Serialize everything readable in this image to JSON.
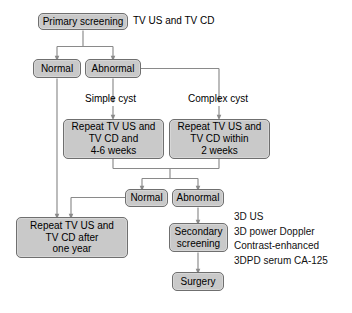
{
  "figure": {
    "type": "flowchart",
    "background_color": "#ffffff",
    "node_fill": "#c9c9c9",
    "node_border": "#6f6f6f",
    "connector_color": "#8a8a8a"
  },
  "nodes": {
    "primary_screening": "Primary screening",
    "normal_1": "Normal",
    "abnormal_1": "Abnormal",
    "repeat_simple": "Repeat TV US and\nTV CD and\n4-6 weeks",
    "repeat_complex": "Repeat TV US and\nTV CD within\n2 weeks",
    "normal_2": "Normal",
    "abnormal_2": "Abnormal",
    "repeat_one_year": "Repeat TV US and\nTV CD after\none year",
    "secondary_screening": "Secondary\nscreening",
    "surgery": "Surgery"
  },
  "labels": {
    "primary_modality": "TV US and TV CD",
    "simple_cyst": "Simple cyst",
    "complex_cyst": "Complex cyst"
  },
  "annotations": {
    "secondary_methods": [
      "3D US",
      "3D power Doppler",
      "Contrast-enhanced",
      "3DPD serum CA-125"
    ]
  }
}
